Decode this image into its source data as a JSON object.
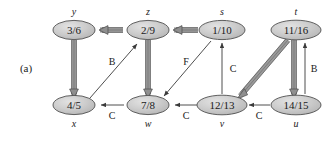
{
  "figure": {
    "panel_label": "(a)",
    "node_fill": "#c9c9c9",
    "node_stroke": "#555555",
    "tree_edge_color": "#8a8a8a",
    "nontree_edge_color": "#4a4a4a",
    "text_color": "#1a1a1a",
    "background": "#ffffff"
  },
  "nodes": [
    {
      "id": "y",
      "name": "y",
      "value": "3/6",
      "cx": 74,
      "cy": 30,
      "name_pos": "above"
    },
    {
      "id": "z",
      "name": "z",
      "value": "2/9",
      "cx": 148,
      "cy": 30,
      "name_pos": "above"
    },
    {
      "id": "s",
      "name": "s",
      "value": "1/10",
      "cx": 222,
      "cy": 30,
      "name_pos": "above"
    },
    {
      "id": "t",
      "name": "t",
      "value": "11/16",
      "cx": 296,
      "cy": 30,
      "name_pos": "above"
    },
    {
      "id": "x",
      "name": "x",
      "value": "4/5",
      "cx": 74,
      "cy": 105,
      "name_pos": "below"
    },
    {
      "id": "w",
      "name": "w",
      "value": "7/8",
      "cx": 148,
      "cy": 105,
      "name_pos": "below"
    },
    {
      "id": "v",
      "name": "v",
      "value": "12/13",
      "cx": 222,
      "cy": 105,
      "name_pos": "below"
    },
    {
      "id": "u",
      "name": "u",
      "value": "14/15",
      "cx": 296,
      "cy": 105,
      "name_pos": "below"
    }
  ],
  "edges": [
    {
      "from": "s",
      "to": "z",
      "kind": "tree",
      "label": ""
    },
    {
      "from": "z",
      "to": "y",
      "kind": "tree",
      "label": ""
    },
    {
      "from": "y",
      "to": "x",
      "kind": "tree",
      "label": ""
    },
    {
      "from": "z",
      "to": "w",
      "kind": "tree",
      "label": ""
    },
    {
      "from": "t",
      "to": "v",
      "kind": "tree",
      "label": ""
    },
    {
      "from": "t",
      "to": "u",
      "kind": "tree",
      "label": ""
    },
    {
      "from": "x",
      "to": "z",
      "kind": "back",
      "label": "B"
    },
    {
      "from": "u",
      "to": "t",
      "kind": "back",
      "label": "B"
    },
    {
      "from": "s",
      "to": "w",
      "kind": "forward",
      "label": "F"
    },
    {
      "from": "v",
      "to": "s",
      "kind": "cross",
      "label": "C"
    },
    {
      "from": "w",
      "to": "x",
      "kind": "cross",
      "label": "C"
    },
    {
      "from": "v",
      "to": "w",
      "kind": "cross",
      "label": "C"
    },
    {
      "from": "u",
      "to": "v",
      "kind": "cross",
      "label": "C"
    }
  ],
  "edge_labels": [
    {
      "text": "B",
      "x": 112,
      "y": 62
    },
    {
      "text": "F",
      "x": 186,
      "y": 62
    },
    {
      "text": "C",
      "x": 232,
      "y": 70
    },
    {
      "text": "B",
      "x": 310,
      "y": 70
    },
    {
      "text": "C",
      "x": 112,
      "y": 118
    },
    {
      "text": "C",
      "x": 186,
      "y": 118
    },
    {
      "text": "C",
      "x": 259,
      "y": 118
    }
  ]
}
